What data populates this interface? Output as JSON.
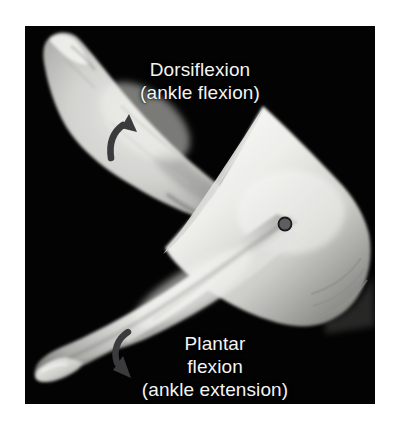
{
  "figure": {
    "type": "anatomy-photograph",
    "background_color": "#ffffff",
    "panel_color": "#030303",
    "label_color": "#f4f4f4"
  },
  "labels": {
    "dorsiflexion": {
      "line1": "Dorsiflexion",
      "line2": "(ankle flexion)"
    },
    "plantarflexion": {
      "line1": "Plantar",
      "line2": "flexion",
      "line3": "(ankle extension)"
    }
  },
  "markers": {
    "malleolus_dot": {
      "name": "joint-axis-marker",
      "fill": "#58585a",
      "stroke": "#1a1a1c",
      "cx": 260,
      "cy": 198,
      "r": 7
    }
  },
  "arrows": {
    "dorsiflexion_arrow": {
      "name": "dorsiflexion-direction-arrow",
      "color": "#3b3b3d",
      "direction": "up-right"
    },
    "plantarflexion_arrow": {
      "name": "plantarflexion-direction-arrow",
      "color": "#3b3b3d",
      "direction": "down-right"
    }
  }
}
